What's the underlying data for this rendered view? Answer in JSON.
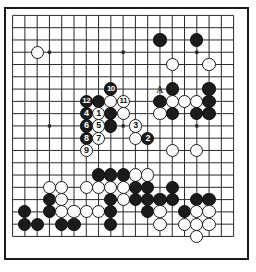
{
  "diagram": {
    "kind": "go-board-diagram",
    "board_size": 19,
    "geometry": {
      "origin_x": 12.6,
      "origin_y": 15.4,
      "spacing": 12.28,
      "stone_diameter": 13.2,
      "frame": {
        "x": 4,
        "y": 7,
        "w": 245,
        "h": 253
      }
    },
    "star_points": [
      {
        "col": 4,
        "row": 4
      },
      {
        "col": 10,
        "row": 4
      },
      {
        "col": 16,
        "row": 4
      },
      {
        "col": 4,
        "row": 10
      },
      {
        "col": 10,
        "row": 10
      },
      {
        "col": 16,
        "row": 10
      },
      {
        "col": 4,
        "row": 16
      },
      {
        "col": 10,
        "row": 16
      },
      {
        "col": 16,
        "row": 16
      }
    ],
    "colors": {
      "black_stone": "#1b1b1b",
      "white_stone": "#fefefe",
      "stone_outline": "#1b1b1b",
      "grid_line": "#2a2a2a",
      "board_background": "#ffffff",
      "black_number_text": "#ffffff",
      "white_number_text": "#101010",
      "label_text": "#111111"
    },
    "stones": [
      {
        "col": 3,
        "row": 4,
        "color": "white",
        "label": ""
      },
      {
        "col": 13,
        "row": 3,
        "color": "black",
        "label": ""
      },
      {
        "col": 16,
        "row": 3,
        "color": "black",
        "label": ""
      },
      {
        "col": 14,
        "row": 5,
        "color": "white",
        "label": ""
      },
      {
        "col": 17,
        "row": 5,
        "color": "white",
        "label": ""
      },
      {
        "col": 14,
        "row": 7,
        "color": "black",
        "label": ""
      },
      {
        "col": 17,
        "row": 7,
        "color": "black",
        "label": ""
      },
      {
        "col": 9,
        "row": 7,
        "color": "black",
        "label": "10"
      },
      {
        "col": 7,
        "row": 8,
        "color": "black",
        "label": "12"
      },
      {
        "col": 8,
        "row": 8,
        "color": "black",
        "label": ""
      },
      {
        "col": 9,
        "row": 8,
        "color": "white",
        "label": ""
      },
      {
        "col": 10,
        "row": 8,
        "color": "white",
        "label": "11"
      },
      {
        "col": 13,
        "row": 8,
        "color": "black",
        "label": ""
      },
      {
        "col": 14,
        "row": 8,
        "color": "white",
        "label": ""
      },
      {
        "col": 15,
        "row": 8,
        "color": "white",
        "label": ""
      },
      {
        "col": 16,
        "row": 8,
        "color": "white",
        "label": ""
      },
      {
        "col": 17,
        "row": 8,
        "color": "black",
        "label": ""
      },
      {
        "col": 7,
        "row": 9,
        "color": "black",
        "label": "4"
      },
      {
        "col": 8,
        "row": 9,
        "color": "white",
        "label": "1"
      },
      {
        "col": 9,
        "row": 9,
        "color": "black",
        "label": ""
      },
      {
        "col": 10,
        "row": 9,
        "color": "white",
        "label": ""
      },
      {
        "col": 13,
        "row": 9,
        "color": "white",
        "label": ""
      },
      {
        "col": 14,
        "row": 9,
        "color": "black",
        "label": ""
      },
      {
        "col": 16,
        "row": 9,
        "color": "black",
        "label": ""
      },
      {
        "col": 17,
        "row": 9,
        "color": "black",
        "label": ""
      },
      {
        "col": 7,
        "row": 10,
        "color": "black",
        "label": "6"
      },
      {
        "col": 8,
        "row": 10,
        "color": "white",
        "label": "5"
      },
      {
        "col": 9,
        "row": 10,
        "color": "black",
        "label": ""
      },
      {
        "col": 11,
        "row": 10,
        "color": "white",
        "label": "3"
      },
      {
        "col": 7,
        "row": 11,
        "color": "black",
        "label": "8"
      },
      {
        "col": 8,
        "row": 11,
        "color": "white",
        "label": "7"
      },
      {
        "col": 11,
        "row": 11,
        "color": "white",
        "label": ""
      },
      {
        "col": 12,
        "row": 11,
        "color": "black",
        "label": "2"
      },
      {
        "col": 7,
        "row": 12,
        "color": "white",
        "label": "9"
      },
      {
        "col": 14,
        "row": 12,
        "color": "white",
        "label": ""
      },
      {
        "col": 16,
        "row": 12,
        "color": "white",
        "label": ""
      },
      {
        "col": 8,
        "row": 14,
        "color": "black",
        "label": ""
      },
      {
        "col": 9,
        "row": 14,
        "color": "black",
        "label": ""
      },
      {
        "col": 10,
        "row": 14,
        "color": "black",
        "label": ""
      },
      {
        "col": 11,
        "row": 14,
        "color": "white",
        "label": ""
      },
      {
        "col": 12,
        "row": 14,
        "color": "white",
        "label": ""
      },
      {
        "col": 4,
        "row": 15,
        "color": "white",
        "label": ""
      },
      {
        "col": 5,
        "row": 15,
        "color": "white",
        "label": ""
      },
      {
        "col": 7,
        "row": 15,
        "color": "white",
        "label": ""
      },
      {
        "col": 8,
        "row": 15,
        "color": "white",
        "label": ""
      },
      {
        "col": 9,
        "row": 15,
        "color": "white",
        "label": ""
      },
      {
        "col": 10,
        "row": 15,
        "color": "white",
        "label": ""
      },
      {
        "col": 11,
        "row": 15,
        "color": "black",
        "label": ""
      },
      {
        "col": 12,
        "row": 15,
        "color": "black",
        "label": ""
      },
      {
        "col": 14,
        "row": 15,
        "color": "black",
        "label": ""
      },
      {
        "col": 4,
        "row": 16,
        "color": "black",
        "label": ""
      },
      {
        "col": 5,
        "row": 16,
        "color": "white",
        "label": ""
      },
      {
        "col": 9,
        "row": 16,
        "color": "black",
        "label": ""
      },
      {
        "col": 10,
        "row": 16,
        "color": "white",
        "label": ""
      },
      {
        "col": 11,
        "row": 16,
        "color": "black",
        "label": ""
      },
      {
        "col": 12,
        "row": 16,
        "color": "black",
        "label": ""
      },
      {
        "col": 13,
        "row": 16,
        "color": "black",
        "label": ""
      },
      {
        "col": 14,
        "row": 16,
        "color": "black",
        "label": ""
      },
      {
        "col": 16,
        "row": 16,
        "color": "black",
        "label": ""
      },
      {
        "col": 17,
        "row": 16,
        "color": "black",
        "label": ""
      },
      {
        "col": 2,
        "row": 17,
        "color": "black",
        "label": ""
      },
      {
        "col": 4,
        "row": 17,
        "color": "black",
        "label": ""
      },
      {
        "col": 5,
        "row": 17,
        "color": "white",
        "label": ""
      },
      {
        "col": 6,
        "row": 17,
        "color": "white",
        "label": ""
      },
      {
        "col": 7,
        "row": 17,
        "color": "white",
        "label": ""
      },
      {
        "col": 8,
        "row": 17,
        "color": "white",
        "label": ""
      },
      {
        "col": 9,
        "row": 17,
        "color": "black",
        "label": ""
      },
      {
        "col": 12,
        "row": 17,
        "color": "black",
        "label": ""
      },
      {
        "col": 13,
        "row": 17,
        "color": "white",
        "label": ""
      },
      {
        "col": 15,
        "row": 17,
        "color": "black",
        "label": ""
      },
      {
        "col": 16,
        "row": 17,
        "color": "white",
        "label": ""
      },
      {
        "col": 17,
        "row": 17,
        "color": "white",
        "label": ""
      },
      {
        "col": 2,
        "row": 18,
        "color": "black",
        "label": ""
      },
      {
        "col": 3,
        "row": 18,
        "color": "black",
        "label": ""
      },
      {
        "col": 5,
        "row": 18,
        "color": "black",
        "label": ""
      },
      {
        "col": 6,
        "row": 18,
        "color": "black",
        "label": ""
      },
      {
        "col": 9,
        "row": 18,
        "color": "black",
        "label": ""
      },
      {
        "col": 13,
        "row": 18,
        "color": "white",
        "label": ""
      },
      {
        "col": 15,
        "row": 18,
        "color": "white",
        "label": ""
      },
      {
        "col": 16,
        "row": 18,
        "color": "white",
        "label": ""
      },
      {
        "col": 17,
        "row": 18,
        "color": "white",
        "label": ""
      },
      {
        "col": 16,
        "row": 19,
        "color": "white",
        "label": ""
      }
    ],
    "point_labels": [
      {
        "col": 13,
        "row": 7,
        "text": "A"
      }
    ],
    "move_numbers": [
      "1",
      "2",
      "3",
      "4",
      "5",
      "6",
      "7",
      "8",
      "9",
      "10",
      "11",
      "12"
    ]
  }
}
